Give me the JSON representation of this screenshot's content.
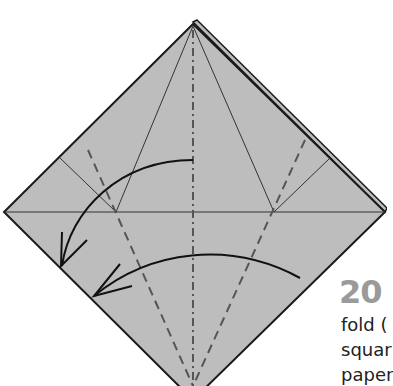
{
  "diagram": {
    "paper_color": "#bdbdbd",
    "outline_color": "#1a1a1a",
    "vertices": {
      "top": [
        193,
        22
      ],
      "left": [
        4,
        212
      ],
      "right": [
        385,
        212
      ],
      "bottom": [
        193,
        386
      ]
    },
    "lines": {
      "valley_folds": [
        "left dashed crease",
        "right dashed crease"
      ],
      "mountain_fold": "center dash-dot vertical line",
      "creases": [
        "horizontal center crease",
        "kite creases from top"
      ]
    },
    "arrows": [
      "upper curved arrow toward lower-left edge",
      "lower curved arrow toward lower-left edge"
    ]
  },
  "step": {
    "number": "20",
    "text_lines": [
      "fold (",
      "squar",
      "paper"
    ]
  }
}
